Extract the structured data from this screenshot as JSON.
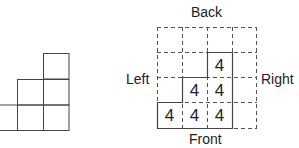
{
  "front_view": {
    "description": "Front elevation of stacked cubes",
    "column_heights": [
      1,
      2,
      3
    ]
  },
  "plan_view": {
    "labels": {
      "top": "Back",
      "bottom": "Front",
      "left": "Left",
      "right": "Right"
    },
    "grid": {
      "rows": 4,
      "cols": 4
    },
    "cells": [
      {
        "row": 1,
        "col": 2,
        "value": "4"
      },
      {
        "row": 2,
        "col": 1,
        "value": "4"
      },
      {
        "row": 2,
        "col": 2,
        "value": "4"
      },
      {
        "row": 3,
        "col": 0,
        "value": "4"
      },
      {
        "row": 3,
        "col": 1,
        "value": "4"
      },
      {
        "row": 3,
        "col": 2,
        "value": "4"
      }
    ]
  }
}
